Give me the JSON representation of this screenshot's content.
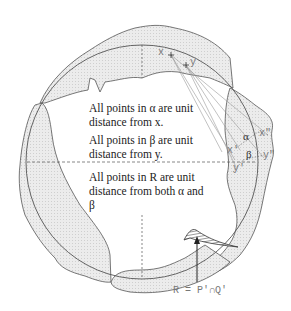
{
  "diagram": {
    "type": "geometric-construction",
    "notes": [
      "All points in α are unit distance from x.",
      "All points in β are unit distance from y.",
      "All points in R are unit distance from both α and β"
    ],
    "note_lines": {
      "n1a": "All points in α are unit",
      "n1b": "distance from x.",
      "n2a": "All points in β are unit",
      "n2b": "distance from y.",
      "n3a": "All points in R are unit",
      "n3b": "distance from both α and",
      "n3c": "β"
    },
    "point_labels": {
      "x": "x",
      "y": "y",
      "alpha": "α",
      "beta": "β",
      "x_prime": "x′",
      "x_double_prime": "x″",
      "y_prime": "y′",
      "y_double_prime": "y″"
    },
    "equation": "R = P′∩Q′",
    "colors": {
      "stroke": "#555555",
      "fill": "#e6e6e6",
      "hatch": "#333333",
      "text": "#222222",
      "label": "#777777"
    }
  }
}
